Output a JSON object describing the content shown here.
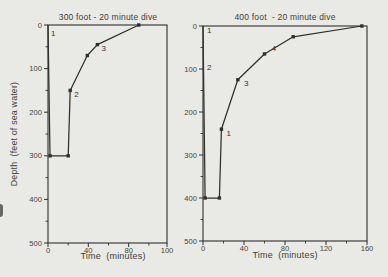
{
  "page": {
    "background": "#e9e9e5",
    "ink": "#2f2f2c",
    "text_color": "#3f3f3c"
  },
  "chart_data": [
    {
      "id": "dive-300",
      "type": "line",
      "title": "300 foot - 20 minute dive",
      "xlabel": "Time  (minutes)",
      "ylabel": "Depth  (feet of sea water)",
      "xlim": [
        0,
        118
      ],
      "ylim": [
        0,
        500
      ],
      "y_inverted": true,
      "grid": "off",
      "x_ticks": [
        {
          "label": "0",
          "at": 0
        },
        {
          "label": "40",
          "at": 40
        },
        {
          "label": "80",
          "at": 80
        },
        {
          "label": "100",
          "at": 118
        }
      ],
      "x_minor_ticks": [
        20,
        60,
        100
      ],
      "y_ticks": [
        {
          "label": "0",
          "at": 0
        },
        {
          "label": "100",
          "at": 100
        },
        {
          "label": "200",
          "at": 200
        },
        {
          "label": "300",
          "at": 300
        },
        {
          "label": "400",
          "at": 400
        },
        {
          "label": "500",
          "at": 500
        }
      ],
      "y_minor_ticks": [
        50,
        150,
        250,
        350,
        450
      ],
      "series": [
        {
          "name": "dive-profile",
          "points": [
            [
              0,
              0
            ],
            [
              2,
              300
            ],
            [
              20,
              300
            ],
            [
              22,
              150
            ],
            [
              39,
              70
            ],
            [
              49,
              45
            ],
            [
              90,
              0
            ]
          ],
          "marker_points": [
            [
              2,
              300
            ],
            [
              20,
              300
            ],
            [
              22,
              150
            ],
            [
              39,
              70
            ],
            [
              49,
              45
            ],
            [
              90,
              0
            ]
          ]
        }
      ],
      "point_labels": [
        {
          "text": "1",
          "x": 3,
          "y": 18
        },
        {
          "text": "2",
          "x": 26,
          "y": 158
        },
        {
          "text": "3",
          "x": 53,
          "y": 53
        }
      ]
    },
    {
      "id": "dive-400",
      "type": "line",
      "title": "400 foot  - 20 minute dive",
      "xlabel": "Time  (minutes)",
      "ylabel": "",
      "xlim": [
        0,
        160
      ],
      "ylim": [
        0,
        500
      ],
      "y_inverted": true,
      "grid": "off",
      "x_ticks": [
        {
          "label": "0",
          "at": 0
        },
        {
          "label": "40",
          "at": 40
        },
        {
          "label": "80",
          "at": 80
        },
        {
          "label": "120",
          "at": 120
        },
        {
          "label": "160",
          "at": 160
        }
      ],
      "x_minor_ticks": [
        20,
        60,
        100,
        140
      ],
      "y_ticks": [
        {
          "label": "0",
          "at": 0
        },
        {
          "label": "100",
          "at": 100
        },
        {
          "label": "200",
          "at": 200
        },
        {
          "label": "300",
          "at": 300
        },
        {
          "label": "400",
          "at": 400
        },
        {
          "label": "500",
          "at": 500
        }
      ],
      "y_minor_ticks": [
        50,
        150,
        250,
        350,
        450
      ],
      "series": [
        {
          "name": "dive-profile",
          "points": [
            [
              0,
              0
            ],
            [
              2,
              400
            ],
            [
              16,
              400
            ],
            [
              18,
              240
            ],
            [
              34,
              125
            ],
            [
              60,
              65
            ],
            [
              88,
              25
            ],
            [
              155,
              0
            ]
          ],
          "marker_points": [
            [
              2,
              400
            ],
            [
              16,
              400
            ],
            [
              18,
              240
            ],
            [
              34,
              125
            ],
            [
              60,
              65
            ],
            [
              88,
              25
            ],
            [
              155,
              0
            ]
          ]
        }
      ],
      "point_labels": [
        {
          "text": "1",
          "x": 4,
          "y": 10
        },
        {
          "text": "2",
          "x": 4,
          "y": 95
        },
        {
          "text": "1",
          "x": 23,
          "y": 248
        },
        {
          "text": "3",
          "x": 40,
          "y": 133
        },
        {
          "text": "4",
          "x": 67,
          "y": 50
        }
      ]
    }
  ]
}
